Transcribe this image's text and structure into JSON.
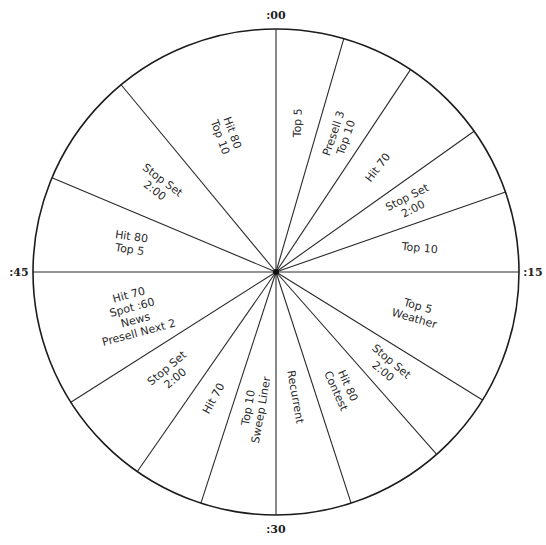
{
  "clock": {
    "center": [
      276,
      272
    ],
    "radius": 243,
    "quarter_labels": [
      {
        "text": ":00",
        "minute": 0
      },
      {
        "text": ":15",
        "minute": 15
      },
      {
        "text": ":30",
        "minute": 30
      },
      {
        "text": ":45",
        "minute": 45
      }
    ],
    "boundaries_minutes": [
      0,
      2.7,
      5.6,
      9.1,
      11.8,
      15,
      20.3,
      23.1,
      27,
      30,
      33,
      35.8,
      39.6,
      45,
      48.8,
      53.4
    ],
    "segments": [
      {
        "id": "seg-top5",
        "start": 0,
        "end": 2.7,
        "lines": [
          "Top 5"
        ],
        "rotate": -88,
        "r": 0.62
      },
      {
        "id": "seg-presell3",
        "start": 2.7,
        "end": 5.6,
        "lines": [
          "Presell 3",
          "Top 10"
        ],
        "rotate": -71,
        "r": 0.62
      },
      {
        "id": "seg-hit70-a",
        "start": 5.6,
        "end": 9.1,
        "lines": [
          "Hit 70"
        ],
        "rotate": -52,
        "r": 0.6
      },
      {
        "id": "seg-stopset-a",
        "start": 9.1,
        "end": 11.8,
        "lines": [
          "Stop Set",
          "2:00"
        ],
        "rotate": -27,
        "r": 0.62
      },
      {
        "id": "seg-top10-a",
        "start": 11.8,
        "end": 15,
        "lines": [
          "Top 10"
        ],
        "rotate": 5,
        "r": 0.6
      },
      {
        "id": "seg-top5-weather",
        "start": 15,
        "end": 20.3,
        "lines": [
          "Top 5",
          "Weather"
        ],
        "rotate": 16,
        "r": 0.6
      },
      {
        "id": "seg-stopset-b",
        "start": 20.3,
        "end": 23.1,
        "lines": [
          "Stop Set",
          "2:00"
        ],
        "rotate": 40,
        "r": 0.6
      },
      {
        "id": "seg-hit80-contest",
        "start": 23.1,
        "end": 27,
        "lines": [
          "Hit 80",
          "Contest"
        ],
        "rotate": 66,
        "r": 0.55
      },
      {
        "id": "seg-recurrent",
        "start": 27,
        "end": 30,
        "lines": [
          "Recurrent"
        ],
        "rotate": 80,
        "r": 0.52
      },
      {
        "id": "seg-top10-sweep",
        "start": 30,
        "end": 33,
        "lines": [
          "Top 10",
          "Sweep Liner"
        ],
        "rotate": -80,
        "r": 0.57
      },
      {
        "id": "seg-hit70-b",
        "start": 33,
        "end": 35.8,
        "lines": [
          "Hit 70"
        ],
        "rotate": -61,
        "r": 0.58
      },
      {
        "id": "seg-stopset-c",
        "start": 35.8,
        "end": 39.6,
        "lines": [
          "Stop Set",
          "2:00"
        ],
        "rotate": -40,
        "r": 0.6
      },
      {
        "id": "seg-hit70-spot",
        "start": 39.6,
        "end": 45,
        "lines": [
          "Hit 70",
          "Spot :60",
          "News",
          "Presell Next 2"
        ],
        "rotate": -15,
        "r": 0.61
      },
      {
        "id": "seg-hit80-top5",
        "start": 45,
        "end": 48.8,
        "lines": [
          "Hit 80",
          "Top 5"
        ],
        "rotate": 8,
        "r": 0.61
      },
      {
        "id": "seg-stopset-d",
        "start": 48.8,
        "end": 53.4,
        "lines": [
          "Stop Set",
          "2:00"
        ],
        "rotate": 37,
        "r": 0.6
      },
      {
        "id": "seg-hit80-top10",
        "start": 53.4,
        "end": 60,
        "lines": [
          "Hit 80",
          "Top 10"
        ],
        "rotate": 70,
        "r": 0.6
      }
    ]
  },
  "colors": {
    "line": "#1c1c1c",
    "text": "#2a2a2a",
    "background": "#ffffff"
  }
}
